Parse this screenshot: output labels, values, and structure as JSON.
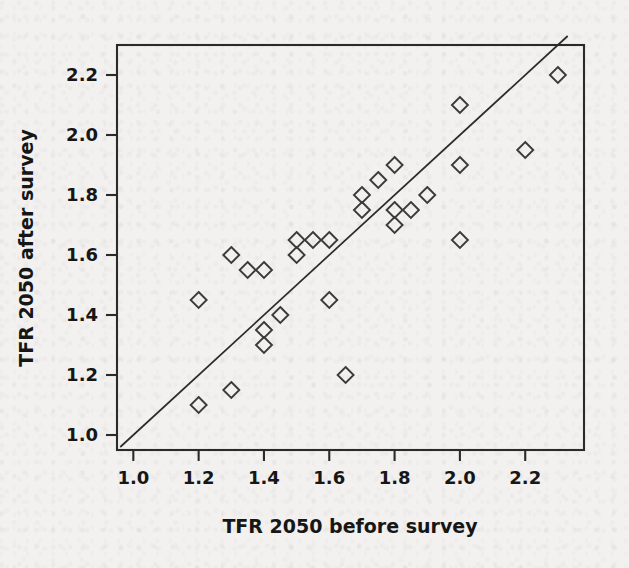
{
  "figure": {
    "background_color": "#f2f1ef",
    "ink_color": "#2a2a2a",
    "marker_color": "#3a3a3a"
  },
  "chart_data": {
    "type": "scatter",
    "title": "",
    "xlabel": "TFR 2050 before survey",
    "ylabel": "TFR 2050 after survey",
    "xlim": [
      0.95,
      2.38
    ],
    "ylim": [
      0.95,
      2.3
    ],
    "xticks": [
      1.0,
      1.2,
      1.4,
      1.6,
      1.8,
      2.0,
      2.2
    ],
    "yticks": [
      1.0,
      1.2,
      1.4,
      1.6,
      1.8,
      2.0,
      2.2
    ],
    "xticklabels": [
      "1.0",
      "1.2",
      "1.4",
      "1.6",
      "1.8",
      "2.0",
      "2.2"
    ],
    "yticklabels": [
      "1.0",
      "1.2",
      "1.4",
      "1.6",
      "1.8",
      "2.0",
      "2.2"
    ],
    "grid": false,
    "legend": null,
    "marker_style": "open-diamond",
    "reference_line": {
      "name": "identity-line",
      "description": "y = x diagonal",
      "slope": 1,
      "intercept": 0,
      "from": [
        0.96,
        0.96
      ],
      "to": [
        2.33,
        2.33
      ]
    },
    "points": [
      {
        "x": 1.2,
        "y": 1.45
      },
      {
        "x": 1.2,
        "y": 1.1
      },
      {
        "x": 1.3,
        "y": 1.6
      },
      {
        "x": 1.3,
        "y": 1.15
      },
      {
        "x": 1.35,
        "y": 1.55
      },
      {
        "x": 1.4,
        "y": 1.55
      },
      {
        "x": 1.4,
        "y": 1.35
      },
      {
        "x": 1.4,
        "y": 1.3
      },
      {
        "x": 1.45,
        "y": 1.4
      },
      {
        "x": 1.5,
        "y": 1.65
      },
      {
        "x": 1.5,
        "y": 1.6
      },
      {
        "x": 1.55,
        "y": 1.65
      },
      {
        "x": 1.6,
        "y": 1.65
      },
      {
        "x": 1.6,
        "y": 1.45
      },
      {
        "x": 1.65,
        "y": 1.2
      },
      {
        "x": 1.7,
        "y": 1.8
      },
      {
        "x": 1.7,
        "y": 1.75
      },
      {
        "x": 1.75,
        "y": 1.85
      },
      {
        "x": 1.8,
        "y": 1.9
      },
      {
        "x": 1.8,
        "y": 1.75
      },
      {
        "x": 1.8,
        "y": 1.7
      },
      {
        "x": 1.85,
        "y": 1.75
      },
      {
        "x": 1.9,
        "y": 1.8
      },
      {
        "x": 2.0,
        "y": 2.1
      },
      {
        "x": 2.0,
        "y": 1.9
      },
      {
        "x": 2.0,
        "y": 1.65
      },
      {
        "x": 2.2,
        "y": 1.95
      },
      {
        "x": 2.3,
        "y": 2.2
      }
    ],
    "point_count": 28
  }
}
